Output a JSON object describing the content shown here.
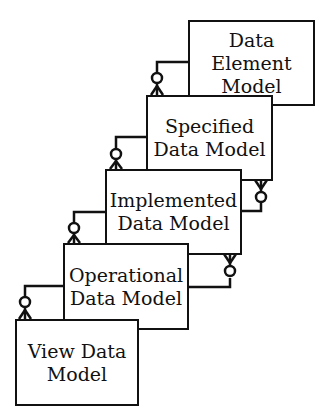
{
  "diagram": {
    "type": "stacked entity relationship (crow's foot) layers",
    "boxes": [
      {
        "id": "data-element-model",
        "label": "Data\nElement\nModel"
      },
      {
        "id": "specified-data-model",
        "label": "Specified\nData Model"
      },
      {
        "id": "implemented-data-model",
        "label": "Implemented\nData Model"
      },
      {
        "id": "operational-data-model",
        "label": "Operational\nData Model"
      },
      {
        "id": "view-data-model",
        "label": "View Data\nModel"
      }
    ],
    "relationships": [
      {
        "from": "data-element-model",
        "to": "specified-data-model",
        "cardinality": "zero-or-many",
        "side": "left"
      },
      {
        "from": "specified-data-model",
        "to": "implemented-data-model",
        "cardinality": "zero-or-many",
        "side": "left"
      },
      {
        "from": "specified-data-model",
        "to": "implemented-data-model",
        "cardinality": "zero-or-many",
        "side": "right"
      },
      {
        "from": "implemented-data-model",
        "to": "operational-data-model",
        "cardinality": "zero-or-many",
        "side": "left"
      },
      {
        "from": "implemented-data-model",
        "to": "operational-data-model",
        "cardinality": "zero-or-many",
        "side": "right"
      },
      {
        "from": "operational-data-model",
        "to": "view-data-model",
        "cardinality": "zero-or-many",
        "side": "left"
      }
    ],
    "colors": {
      "stroke": "#111111",
      "fill": "#ffffff"
    }
  }
}
